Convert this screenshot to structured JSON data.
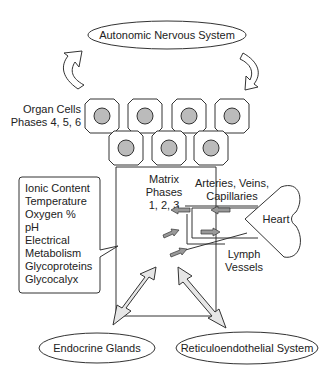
{
  "diagram": {
    "ans": {
      "label": "Autonomic Nervous System"
    },
    "organ_cells": {
      "line1": "Organ Cells",
      "line2": "Phases 4, 5, 6"
    },
    "matrix": {
      "line1": "Matrix",
      "line2": "Phases",
      "line3": "1, 2, 3"
    },
    "vessels": {
      "line1": "Arteries, Veins,",
      "line2": "Capillaries"
    },
    "heart": {
      "label": "Heart"
    },
    "lymph": {
      "line1": "Lymph",
      "line2": "Vessels"
    },
    "properties": [
      "Ionic Content",
      "Temperature",
      "Oxygen %",
      "pH",
      "Electrical",
      "Metabolism",
      "Glycoproteins",
      "Glycocalyx"
    ],
    "endocrine": {
      "label": "Endocrine Glands"
    },
    "res": {
      "label": "Reticuloendothelial System"
    }
  }
}
